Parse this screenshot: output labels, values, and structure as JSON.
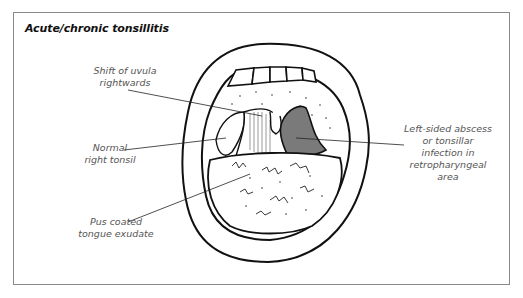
{
  "figure": {
    "title": "Acute/chronic tonsillitis",
    "labels": [
      {
        "id": "uvula",
        "lines": [
          "Shift of uvula",
          "rightwards"
        ]
      },
      {
        "id": "right-tonsil",
        "lines": [
          "Normal",
          "right tonsil"
        ]
      },
      {
        "id": "tongue",
        "lines": [
          "Pus coated",
          "tongue exudate"
        ]
      },
      {
        "id": "abscess",
        "lines": [
          "Left-sided abscess",
          "or tonsillar",
          "infection in",
          "retropharyngeal",
          "area"
        ]
      }
    ],
    "colors": {
      "frame": "#8a8a8a",
      "ink": "#111111",
      "label_text": "#555555",
      "abscess_fill": "#7a7a7a"
    }
  }
}
